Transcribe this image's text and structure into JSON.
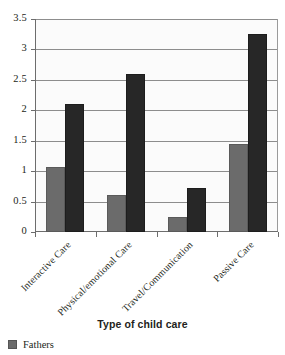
{
  "chart_data": {
    "type": "bar",
    "title": "",
    "xlabel": "Type of child care",
    "ylabel": "",
    "ylim": [
      0,
      3.5
    ],
    "ytick_values": [
      0,
      0.5,
      1,
      1.5,
      2,
      2.5,
      3,
      3.5
    ],
    "ytick_labels": [
      "0",
      "0.5",
      "1",
      "1.5",
      "2",
      "2.5",
      "3",
      "3.5"
    ],
    "grid": true,
    "legend_position": "below-left",
    "categories": [
      "Interactive Care",
      "Physical/emotional Care",
      "Travel/Communication",
      "Passive Care"
    ],
    "series": [
      {
        "name": "Fathers",
        "color": "#6b6b6b",
        "values": [
          1.07,
          0.6,
          0.25,
          1.45
        ]
      },
      {
        "name": "Mothers",
        "color": "#272727",
        "values": [
          2.1,
          2.6,
          0.72,
          3.25
        ]
      }
    ]
  },
  "legend": {
    "entries": [
      {
        "label": "Fathers",
        "color": "#6b6b6b"
      }
    ]
  },
  "colors": {
    "fathers": "#6b6b6b",
    "mothers": "#272727",
    "axis": "#6d6d6d",
    "grid": "#8d8d8d",
    "plot_background": "#fbfbfb",
    "text": "#231f20"
  }
}
